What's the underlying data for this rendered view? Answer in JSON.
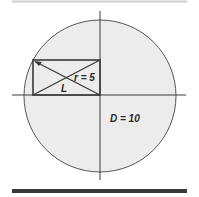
{
  "diagram": {
    "labels": {
      "radius": "r = 5",
      "diagonal": "L",
      "diameter": "D = 10"
    },
    "colors": {
      "circle_fill": "#ececec",
      "stroke": "#3a3a3a",
      "rule_top": "#cfcfcf",
      "rule_bottom": "#3a3a3a"
    }
  }
}
